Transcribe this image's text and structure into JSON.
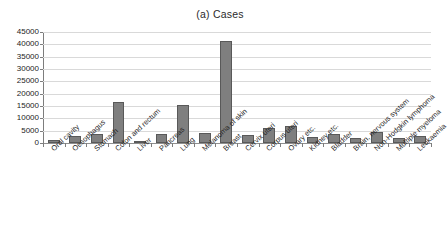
{
  "chart_data": {
    "type": "bar",
    "title": "(a) Cases",
    "xlabel": "",
    "ylabel": "",
    "ylim": [
      0,
      45000
    ],
    "ytick_step": 5000,
    "yticks": [
      0,
      5000,
      10000,
      15000,
      20000,
      25000,
      30000,
      35000,
      40000,
      45000
    ],
    "ytick_labels": [
      "0",
      "5000",
      "10000",
      "15000",
      "20000",
      "25000",
      "30000",
      "35000",
      "40000",
      "45000"
    ],
    "grid": true,
    "legend": false,
    "bar_color": "#7f7f7f",
    "bar_edge_color": "#595959",
    "categories": [
      "Oral cavity",
      "Oesophagus",
      "Stomach",
      "Colon and rectum",
      "Liver",
      "Pancreas",
      "Lung",
      "Melanoma of skin",
      "Breast",
      "Cervix uteri",
      "Corpus uteri",
      "Ovary etc.",
      "Kidney etc.",
      "Bladder",
      "Brain, nervous system",
      "Non-Hodgkin lymphoma",
      "Multiple myeloma",
      "Leukaemia"
    ],
    "values": [
      1400,
      2900,
      3600,
      16600,
      900,
      3600,
      15500,
      4100,
      41200,
      3200,
      6000,
      6700,
      2600,
      3700,
      2200,
      4500,
      2100,
      3000
    ]
  }
}
